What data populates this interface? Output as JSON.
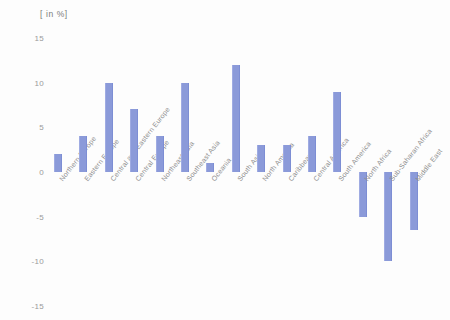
{
  "chart_data": {
    "type": "bar",
    "title": "[ in %]",
    "xlabel": "",
    "ylabel": "[ in %]",
    "ylim": [
      -15,
      15
    ],
    "yticks": [
      15,
      10,
      5,
      0,
      -5,
      -10,
      -15
    ],
    "ytick_labels": [
      "15",
      "10",
      "5",
      "0",
      "-5",
      "-10",
      "-15"
    ],
    "grid": false,
    "legend": "none",
    "bar_color": "#8b9ad9",
    "categories": [
      "Northern Europe",
      "Eastern Europe",
      "Central and Eastern Europe",
      "Central Europe",
      "Northeast Asia",
      "Southeast Asia",
      "Oceania",
      "South Asia",
      "North America",
      "Caribbean",
      "Central America",
      "South America",
      "North Africa",
      "Sub-Saharan Africa",
      "Middle East"
    ],
    "values": [
      2,
      4,
      10,
      7,
      4,
      10,
      1,
      12,
      3,
      3,
      4,
      9,
      -5,
      -10,
      -6.5
    ]
  }
}
